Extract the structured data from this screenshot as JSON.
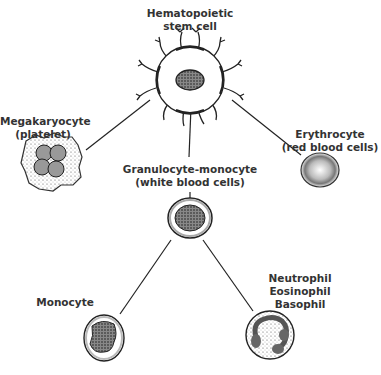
{
  "diagram": {
    "nodes": [
      {
        "id": "stem",
        "label_lines": [
          "Hematopoietic",
          "stem cell"
        ]
      },
      {
        "id": "megakaryocyte",
        "label_lines": [
          "Megakaryocyte",
          "(platelet)"
        ]
      },
      {
        "id": "granulocyte_monocyte",
        "label_lines": [
          "Granulocyte-monocyte",
          "(white blood cells)"
        ]
      },
      {
        "id": "erythrocyte",
        "label_lines": [
          "Erythrocyte",
          "(red blood cells)"
        ]
      },
      {
        "id": "monocyte",
        "label_lines": [
          "Monocyte"
        ]
      },
      {
        "id": "granulocytes",
        "label_lines": [
          "Neutrophil",
          "Eosinophil",
          "Basophil"
        ]
      }
    ],
    "edges": [
      {
        "from": "stem",
        "to": "megakaryocyte"
      },
      {
        "from": "stem",
        "to": "granulocyte_monocyte"
      },
      {
        "from": "stem",
        "to": "erythrocyte"
      },
      {
        "from": "granulocyte_monocyte",
        "to": "monocyte"
      },
      {
        "from": "granulocyte_monocyte",
        "to": "granulocytes"
      }
    ]
  }
}
